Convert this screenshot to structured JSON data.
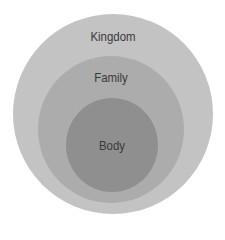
{
  "diagram": {
    "type": "nested-circles",
    "rings": [
      {
        "label": "Kingdom",
        "color": "#c3c3c3"
      },
      {
        "label": "Family",
        "color": "#acacac"
      },
      {
        "label": "Body",
        "color": "#8f8f8f"
      }
    ]
  }
}
